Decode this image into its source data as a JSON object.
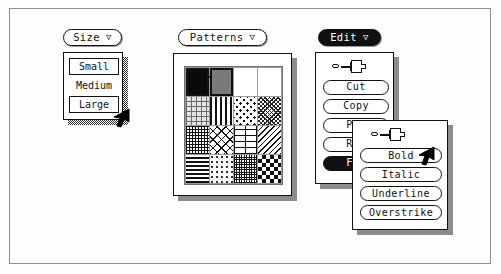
{
  "size_menu": {
    "title": "Size",
    "caret": "▽",
    "items": [
      {
        "label": "Small",
        "state": "boxed"
      },
      {
        "label": "Medium",
        "state": "plain"
      },
      {
        "label": "Large",
        "state": "boxed"
      }
    ],
    "cursor": "arrow-cursor"
  },
  "patterns_menu": {
    "title": "Patterns",
    "caret": "▽",
    "grid": {
      "rows": 4,
      "cols": 4,
      "selected_index": 1,
      "swatches": [
        {
          "name": "solid-black",
          "fill": "p-black"
        },
        {
          "name": "solid-gray",
          "fill": "p-gray"
        },
        {
          "name": "wavy-lines",
          "fill": "p-wavy"
        },
        {
          "name": "solid-white",
          "fill": "p-white"
        },
        {
          "name": "dotted-grid",
          "fill": "p-dotgrid"
        },
        {
          "name": "vertical-bars",
          "fill": "p-vbars"
        },
        {
          "name": "interlocked-circles",
          "fill": "p-circles"
        },
        {
          "name": "dense-mesh",
          "fill": "p-dense"
        },
        {
          "name": "fine-grid",
          "fill": "p-grid"
        },
        {
          "name": "cross-hatch",
          "fill": "p-xhatch"
        },
        {
          "name": "brick",
          "fill": "p-brick"
        },
        {
          "name": "diagonal-lines",
          "fill": "p-diag"
        },
        {
          "name": "horizontal-bars",
          "fill": "p-hbars"
        },
        {
          "name": "sparse-dots",
          "fill": "p-sparse"
        },
        {
          "name": "tight-grid",
          "fill": "p-tight"
        },
        {
          "name": "checkerboard",
          "fill": "p-checker"
        }
      ]
    },
    "cursor": "arrow-cursor"
  },
  "edit_menu": {
    "title": "Edit",
    "caret": "▽",
    "title_state": "inverted",
    "pin": "thumbtack-icon",
    "items": [
      {
        "label": "Cut",
        "state": "normal",
        "clipped": false
      },
      {
        "label": "Copy",
        "state": "normal",
        "clipped": false
      },
      {
        "label": "Pas",
        "state": "normal",
        "clipped": true
      },
      {
        "label": "Reg",
        "state": "normal",
        "clipped": true
      },
      {
        "label": "For",
        "state": "highlighted",
        "clipped": true
      }
    ]
  },
  "font_submenu": {
    "pin": "thumbtack-icon",
    "items": [
      {
        "label": "Bold",
        "state": "selected"
      },
      {
        "label": "Italic",
        "state": "normal"
      },
      {
        "label": "Underline",
        "state": "normal"
      },
      {
        "label": "Overstrike",
        "state": "normal"
      }
    ],
    "cursor": "arrow-cursor"
  },
  "colors": {
    "ink": "#111111",
    "paper": "#ffffff",
    "frame": "#8f8f8f",
    "shadow": "#8c8c8c",
    "gray_swatch": "#7a7a7a"
  }
}
